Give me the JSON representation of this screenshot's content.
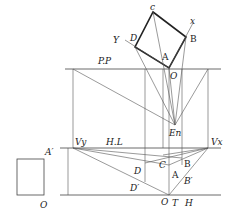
{
  "diagram": {
    "type": "two-point perspective construction",
    "labels": {
      "c": "c",
      "x": "x",
      "D_top": "D",
      "Y": "Y",
      "B_top": "B",
      "A_top": "A",
      "O_top": "O",
      "pp": "P.P",
      "en": "En",
      "vy": "Vy",
      "hl": "H.L",
      "vx": "Vx",
      "a_prime": "A′",
      "o_left": "O",
      "c_low": "C",
      "d_low": "D",
      "b_low": "B",
      "a_low": "A",
      "b_prime": "B′",
      "d_prime": "D′",
      "o_bottom": "O",
      "t": "T",
      "h": "H"
    },
    "points": {
      "plan_c": [
        153,
        12
      ],
      "plan_B": [
        186,
        37
      ],
      "plan_O": [
        169,
        68
      ],
      "plan_D": [
        135,
        47
      ],
      "station_En": [
        175,
        125
      ],
      "Vy": [
        73,
        148
      ],
      "Vx": [
        208,
        148
      ],
      "ground_O": [
        169,
        195
      ],
      "elev_square": [
        17,
        159,
        44,
        195
      ]
    },
    "lines": {
      "picture_plane_y": 69,
      "horizon_line_y": 148,
      "ground_line_y": 195
    },
    "colors": {
      "ink": "#222222",
      "construction": "#555555",
      "background": "#ffffff"
    }
  }
}
